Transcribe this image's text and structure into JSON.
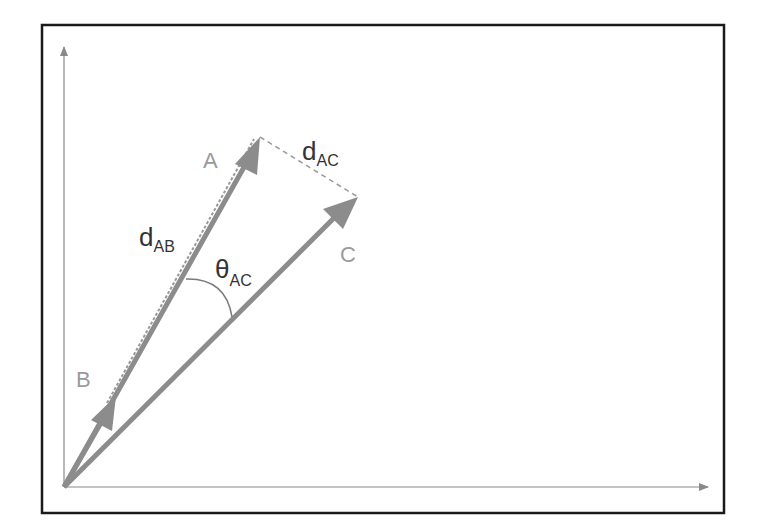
{
  "diagram": {
    "frame": {
      "x": 42,
      "y": 25,
      "width": 682,
      "height": 488,
      "stroke": "#1a1a1a"
    },
    "axes": {
      "origin": [
        64,
        487
      ],
      "x_end": [
        708,
        487
      ],
      "y_end": [
        64,
        46
      ],
      "color": "#8a8a8a"
    },
    "colors": {
      "vector": "#8c8c8c",
      "label_vector": "#9a9a9a",
      "label_math": "#333333",
      "dashed": "#9a9a9a",
      "arc": "#7a7a7a"
    },
    "vectors": [
      {
        "id": "A",
        "label": "A",
        "tip": [
          260,
          137
        ],
        "label_pos": [
          203,
          168
        ]
      },
      {
        "id": "B",
        "label": "B",
        "tip": [
          116,
          396
        ],
        "label_pos": [
          76,
          387
        ]
      },
      {
        "id": "C",
        "label": "C",
        "tip": [
          358,
          197
        ],
        "label_pos": [
          340,
          262
        ]
      }
    ],
    "annotations": {
      "d_AC": {
        "main": "d",
        "sub": "AC"
      },
      "d_AB": {
        "main": "d",
        "sub": "AB"
      },
      "theta_AC": {
        "main": "θ",
        "sub": "AC"
      }
    }
  }
}
